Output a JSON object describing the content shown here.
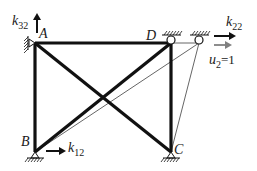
{
  "diagram": {
    "title": "",
    "nodes": [
      {
        "id": "A",
        "label": "A",
        "x": 35,
        "y": 43
      },
      {
        "id": "B",
        "label": "B",
        "x": 35,
        "y": 152
      },
      {
        "id": "C",
        "label": "C",
        "x": 171,
        "y": 152
      },
      {
        "id": "D",
        "label": "D",
        "x": 171,
        "y": 43
      },
      {
        "id": "D_displaced",
        "label": "",
        "x": 199,
        "y": 43
      }
    ],
    "members": [
      {
        "from": "A",
        "to": "D",
        "style": "thick"
      },
      {
        "from": "A",
        "to": "B",
        "style": "thick"
      },
      {
        "from": "D",
        "to": "C",
        "style": "thick"
      },
      {
        "from": "A",
        "to": "C",
        "style": "thick"
      },
      {
        "from": "B",
        "to": "D",
        "style": "thick"
      },
      {
        "from": "B",
        "to": "D_displaced",
        "style": "thin"
      },
      {
        "from": "C",
        "to": "D_displaced",
        "style": "thin"
      }
    ],
    "labels": {
      "A": "A",
      "B": "B",
      "C": "C",
      "D": "D",
      "k32_main": "k",
      "k32_sub": "32",
      "k22_main": "k",
      "k22_sub": "22",
      "k12_main": "k",
      "k12_sub": "12",
      "u2_main": "u",
      "u2_sub": "2",
      "u2_value": "=1"
    },
    "colors": {
      "member": "#111111",
      "thin_member": "#555555",
      "displacement_arrow": "#808080",
      "force_arrow": "#111111"
    }
  }
}
